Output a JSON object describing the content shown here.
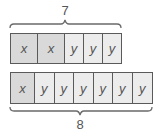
{
  "diagram": {
    "top": {
      "total_label": "7",
      "cells": [
        "x",
        "x",
        "y",
        "y",
        "y"
      ]
    },
    "bottom": {
      "total_label": "8",
      "cells": [
        "x",
        "y",
        "y",
        "y",
        "y",
        "y",
        "y"
      ]
    }
  },
  "colors": {
    "x_fill": "#d9d9d9",
    "y_fill": "#ececec",
    "stroke": "#5a5a5a"
  }
}
